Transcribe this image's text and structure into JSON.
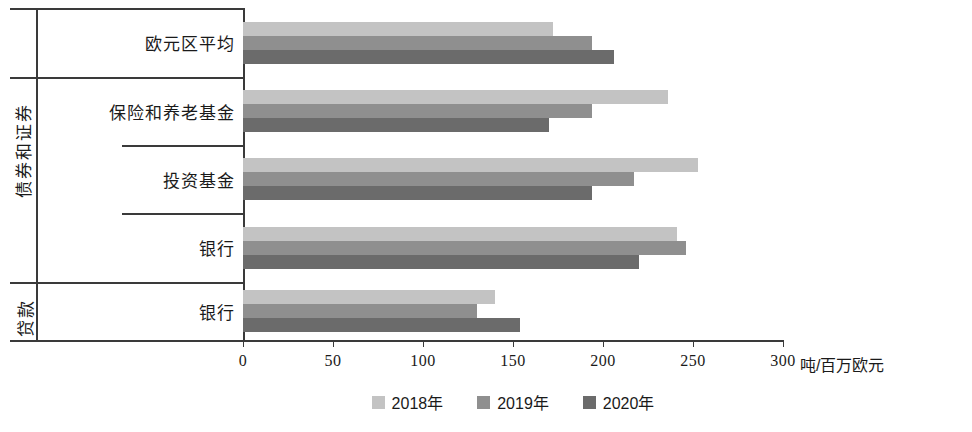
{
  "chart_data": {
    "type": "bar",
    "orientation": "horizontal",
    "title": "",
    "xlabel": "吨/百万欧元",
    "ylabel": "",
    "xlim": [
      0,
      300
    ],
    "xticks": [
      0,
      50,
      100,
      150,
      200,
      250,
      300
    ],
    "xtick_labels": [
      "0",
      "50",
      "100",
      "150",
      "200",
      "250",
      "300"
    ],
    "grid": false,
    "legend_position": "bottom-center",
    "categories": [
      "欧元区平均",
      "保险和养老基金",
      "投资基金",
      "银行",
      "银行"
    ],
    "group_labels": [
      "",
      "债券和证券",
      "债券和证券",
      "债券和证券",
      "贷款"
    ],
    "series": [
      {
        "name": "2018年",
        "color": "#c3c3c3",
        "values": [
          172,
          236,
          253,
          241,
          140
        ]
      },
      {
        "name": "2019年",
        "color": "#8f8f8f",
        "values": [
          194,
          194,
          217,
          246,
          130
        ]
      },
      {
        "name": "2020年",
        "color": "#6b6b6b",
        "values": [
          206,
          170,
          194,
          220,
          154
        ]
      }
    ]
  },
  "axis": {
    "unit_label": "吨/百万欧元",
    "tick_labels": [
      "0",
      "50",
      "100",
      "150",
      "200",
      "250",
      "300"
    ]
  },
  "row_labels": [
    {
      "label": "欧元区平均"
    },
    {
      "label": "保险和养老基金"
    },
    {
      "label": "投资基金"
    },
    {
      "label": "银行"
    },
    {
      "label": "银行"
    }
  ],
  "group_names": {
    "bonds": "债券和证券",
    "loans": "贷款"
  },
  "legend": {
    "items": [
      {
        "label": "2018年",
        "color": "#c3c3c3"
      },
      {
        "label": "2019年",
        "color": "#8f8f8f"
      },
      {
        "label": "2020年",
        "color": "#6b6b6b"
      }
    ]
  }
}
